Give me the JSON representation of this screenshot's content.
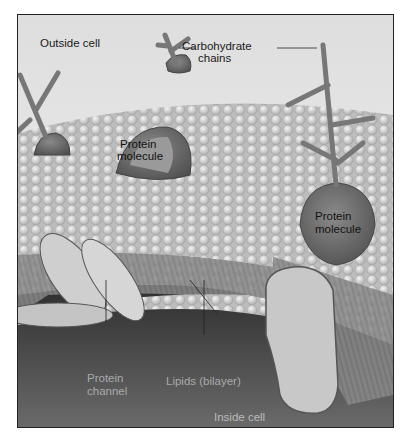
{
  "figure": {
    "type": "cell-membrane-diagram",
    "labels": {
      "outside_cell": "Outside cell",
      "carbohydrate_chains_line1": "Carbohydrate",
      "carbohydrate_chains_line2": "chains",
      "protein_molecule_1_line1": "Protein",
      "protein_molecule_1_line2": "molecule",
      "protein_molecule_2_line1": "Protein",
      "protein_molecule_2_line2": "molecule",
      "protein_channel_line1": "Protein",
      "protein_channel_line2": "channel",
      "lipids_bilayer": "Lipids (bilayer)",
      "inside_cell": "Inside cell"
    },
    "colors": {
      "background_top": "#e8e8e8",
      "lipid_heads": "#c9c9c9",
      "protein": "#6e6e6e",
      "inside_dark": "#3a3a3a",
      "border": "#222222"
    }
  }
}
